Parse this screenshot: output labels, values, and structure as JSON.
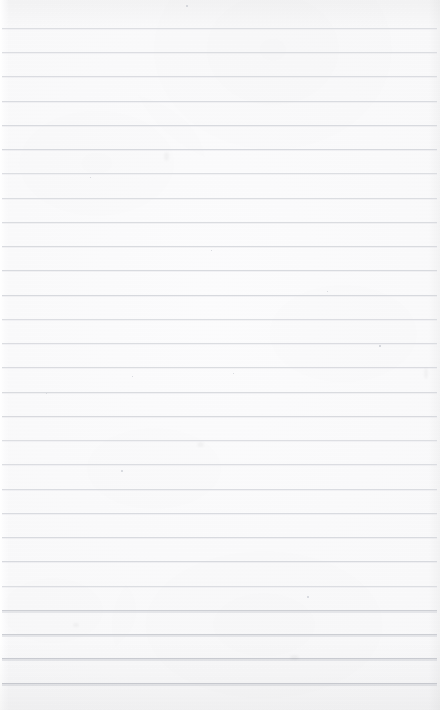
{
  "document": {
    "kind": "scanned-ruled-paper",
    "title": "Blank lined notebook page",
    "description": "Scan of an empty sheet of ruled notebook paper with no handwriting or printed text",
    "width": 440,
    "height": 710,
    "has_text": false,
    "text_content": "",
    "orientation": "portrait"
  },
  "paper": {
    "background_color": "#fbfbfc",
    "tone_color": "#f6f6f8",
    "rule_color": "#d6d8dd",
    "rule_color_heavy": "#caccd2",
    "speck_color": "#cfd2d8",
    "has_margin_rule": false,
    "has_holes": false
  },
  "ruling": {
    "line_count": 28,
    "first_line_y": 28,
    "spacing_px": 24.2,
    "line_thickness_px": 1,
    "inset_left_px": 2,
    "inset_right_px": 3,
    "heavy_from_index": 24,
    "lines": [
      {
        "y": 28,
        "left": 2,
        "right": 437,
        "weight": "normal"
      },
      {
        "y": 52,
        "left": 2,
        "right": 437,
        "weight": "normal"
      },
      {
        "y": 76,
        "left": 2,
        "right": 437,
        "weight": "normal"
      },
      {
        "y": 101,
        "left": 2,
        "right": 437,
        "weight": "normal"
      },
      {
        "y": 125,
        "left": 2,
        "right": 437,
        "weight": "normal"
      },
      {
        "y": 149,
        "left": 2,
        "right": 437,
        "weight": "normal"
      },
      {
        "y": 173,
        "left": 2,
        "right": 437,
        "weight": "normal"
      },
      {
        "y": 198,
        "left": 2,
        "right": 437,
        "weight": "normal"
      },
      {
        "y": 222,
        "left": 2,
        "right": 437,
        "weight": "normal"
      },
      {
        "y": 246,
        "left": 2,
        "right": 437,
        "weight": "normal"
      },
      {
        "y": 270,
        "left": 2,
        "right": 437,
        "weight": "normal"
      },
      {
        "y": 295,
        "left": 2,
        "right": 437,
        "weight": "normal"
      },
      {
        "y": 319,
        "left": 2,
        "right": 437,
        "weight": "normal"
      },
      {
        "y": 343,
        "left": 2,
        "right": 437,
        "weight": "normal"
      },
      {
        "y": 367,
        "left": 2,
        "right": 437,
        "weight": "normal"
      },
      {
        "y": 392,
        "left": 2,
        "right": 437,
        "weight": "normal"
      },
      {
        "y": 416,
        "left": 2,
        "right": 437,
        "weight": "normal"
      },
      {
        "y": 440,
        "left": 2,
        "right": 437,
        "weight": "normal"
      },
      {
        "y": 464,
        "left": 2,
        "right": 437,
        "weight": "normal"
      },
      {
        "y": 489,
        "left": 2,
        "right": 437,
        "weight": "normal"
      },
      {
        "y": 513,
        "left": 2,
        "right": 437,
        "weight": "normal"
      },
      {
        "y": 537,
        "left": 2,
        "right": 437,
        "weight": "normal"
      },
      {
        "y": 561,
        "left": 2,
        "right": 437,
        "weight": "normal"
      },
      {
        "y": 586,
        "left": 2,
        "right": 437,
        "weight": "normal"
      },
      {
        "y": 610,
        "left": 2,
        "right": 437,
        "weight": "heavy"
      },
      {
        "y": 634,
        "left": 2,
        "right": 437,
        "weight": "heavy"
      },
      {
        "y": 658,
        "left": 2,
        "right": 437,
        "weight": "heavy"
      },
      {
        "y": 683,
        "left": 2,
        "right": 437,
        "weight": "heavy"
      }
    ]
  },
  "marks": {
    "specks": [
      {
        "x": 307,
        "y": 596,
        "size": 2.0
      },
      {
        "x": 121,
        "y": 470,
        "size": 1.8
      },
      {
        "x": 379,
        "y": 345,
        "size": 1.6
      },
      {
        "x": 186,
        "y": 5,
        "size": 1.6
      },
      {
        "x": 233,
        "y": 373,
        "size": 1.4
      },
      {
        "x": 46,
        "y": 393,
        "size": 1.3
      },
      {
        "x": 132,
        "y": 376,
        "size": 1.3
      },
      {
        "x": 211,
        "y": 250,
        "size": 1.2
      },
      {
        "x": 327,
        "y": 291,
        "size": 1.2
      },
      {
        "x": 90,
        "y": 177,
        "size": 1.2
      }
    ],
    "smudges": [
      {
        "x": 164,
        "y": 152,
        "w": 5,
        "h": 9
      },
      {
        "x": 424,
        "y": 368,
        "w": 4,
        "h": 11
      },
      {
        "x": 197,
        "y": 442,
        "w": 7,
        "h": 5
      },
      {
        "x": 290,
        "y": 655,
        "w": 9,
        "h": 5
      },
      {
        "x": 73,
        "y": 623,
        "w": 6,
        "h": 4
      }
    ]
  }
}
